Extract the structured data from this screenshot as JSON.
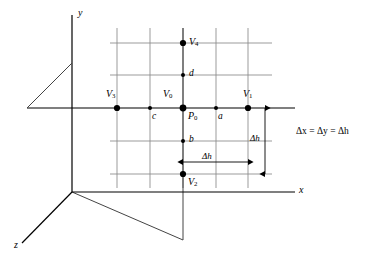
{
  "figure": {
    "background_color": "#ffffff",
    "line_color": "#000000",
    "grid_color": "#888888",
    "axis_color": "#000000"
  },
  "axes": {
    "x_label": "x",
    "y_label": "y",
    "z_label": "z",
    "origin": {
      "x": 72,
      "y": 192
    }
  },
  "grid": {
    "vertical_lines_x": [
      117,
      150,
      183,
      216,
      248
    ],
    "horizontal_lines_y": [
      43,
      75,
      108,
      141,
      174
    ],
    "horizontal_extent": {
      "x1": 110,
      "x2": 272
    },
    "vertical_extent": {
      "y1": 28,
      "y2": 188
    },
    "spacing_px": 33
  },
  "nodes": [
    {
      "id": "V4",
      "label": "V",
      "sub": "4",
      "x": 183,
      "y": 43,
      "size": "large",
      "label_dx": 6,
      "label_dy": -4
    },
    {
      "id": "d",
      "label": "d",
      "sub": "",
      "x": 183,
      "y": 75,
      "size": "small",
      "label_dx": 6,
      "label_dy": -4
    },
    {
      "id": "V3",
      "label": "V",
      "sub": "3",
      "x": 117,
      "y": 108,
      "size": "large",
      "label_dx": -9,
      "label_dy": -17
    },
    {
      "id": "c",
      "label": "c",
      "sub": "",
      "x": 150,
      "y": 108,
      "size": "small",
      "label_dx": 3,
      "label_dy": 6
    },
    {
      "id": "P0",
      "label": "P",
      "sub": "0",
      "x": 183,
      "y": 108,
      "size": "large",
      "label_dx": 6,
      "label_dy": 5
    },
    {
      "id": "V0",
      "label": "V",
      "sub": "0",
      "x": 183,
      "y": 108,
      "size": "none",
      "label_dx": -18,
      "label_dy": -17
    },
    {
      "id": "a",
      "label": "a",
      "sub": "",
      "x": 216,
      "y": 108,
      "size": "small",
      "label_dx": 3,
      "label_dy": 6
    },
    {
      "id": "V1",
      "label": "V",
      "sub": "1",
      "x": 248,
      "y": 108,
      "size": "large",
      "label_dx": -3,
      "label_dy": -17
    },
    {
      "id": "b",
      "label": "b",
      "sub": "",
      "x": 183,
      "y": 141,
      "size": "small",
      "label_dx": 6,
      "label_dy": -4
    },
    {
      "id": "V2",
      "label": "V",
      "sub": "2",
      "x": 183,
      "y": 174,
      "size": "large",
      "label_dx": 5,
      "label_dy": 5
    }
  ],
  "dimensions": {
    "horizontal": {
      "label": "Δh",
      "label_x": 202,
      "label_y": 157,
      "y": 162,
      "x1": 183,
      "x2": 248
    },
    "vertical": {
      "label": "Δh",
      "label_x": 252,
      "label_y": 139,
      "x": 265,
      "y1": 108,
      "y2": 174
    }
  },
  "equation": {
    "text": "Δx = Δy = Δh",
    "parts": [
      {
        "symbol": "Δ",
        "var": "x"
      },
      {
        "symbol": "Δ",
        "var": "y"
      },
      {
        "symbol": "Δ",
        "var": "h"
      }
    ],
    "x": 297,
    "y": 131
  },
  "plane_edges": {
    "upper_left_diagonal": {
      "x1": 27,
      "y1": 108,
      "x2": 72,
      "y2": 63
    },
    "lower_right_diagonal": {
      "x1": 72,
      "y1": 192,
      "x2": 183,
      "y2": 240
    },
    "right_vertical_drop": {
      "x": 183,
      "y1": 188,
      "y2": 240
    },
    "x_axis": {
      "x1": 27,
      "y1": 108,
      "x2": 295,
      "y2": 108
    }
  }
}
